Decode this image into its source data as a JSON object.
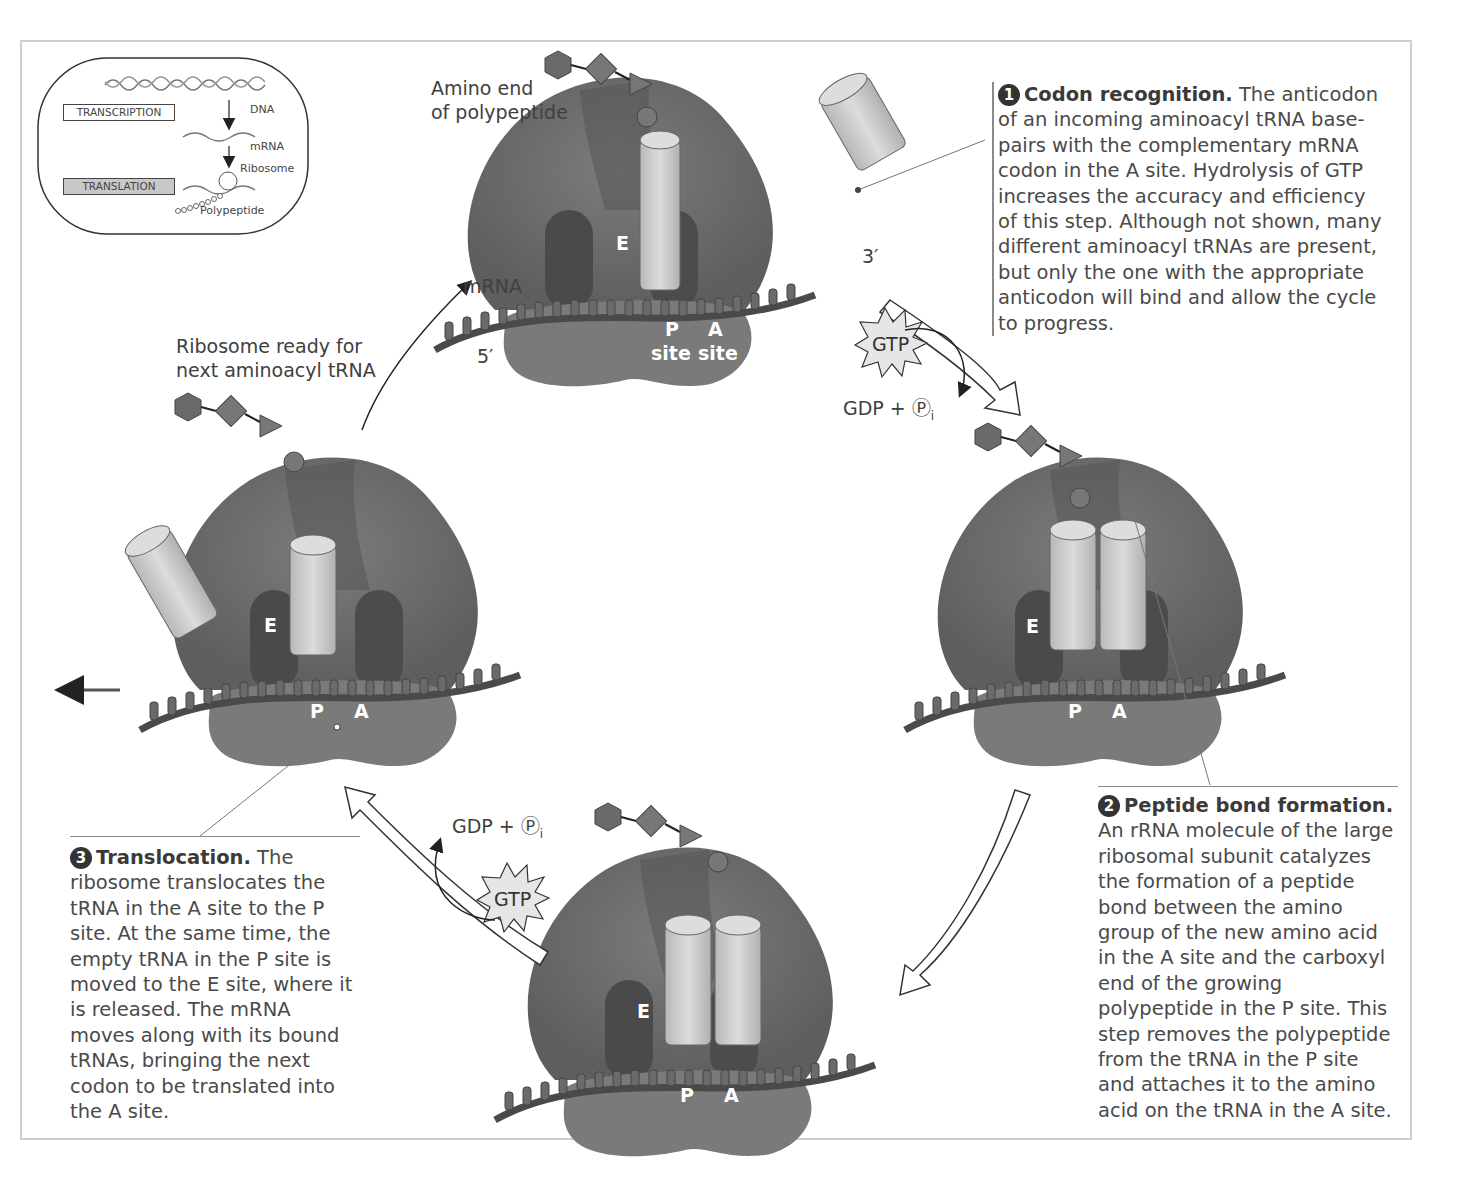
{
  "inset": {
    "dna_label": "DNA",
    "mrna_label": "mRNA",
    "ribosome_label": "Ribosome",
    "polypeptide_label": "Polypeptide",
    "transcription_box": "TRANSCRIPTION",
    "translation_box": "TRANSLATION"
  },
  "labels": {
    "amino_end_line1": "Amino end",
    "amino_end_line2": "of polypeptide",
    "mrna": "mRNA",
    "five_prime": "5′",
    "three_prime": "3′",
    "ready_line1": "Ribosome ready for",
    "ready_line2": "next aminoacyl tRNA",
    "gtp": "GTP",
    "gdp_pi": "GDP + Ⓟ",
    "subscript_i": "i"
  },
  "ribosomes": [
    {
      "position": "top",
      "e": "E",
      "p": "P",
      "a": "A",
      "p_site": "site",
      "a_site": "site"
    },
    {
      "position": "right",
      "e": "E",
      "p": "P",
      "a": "A"
    },
    {
      "position": "bottom",
      "e": "E",
      "p": "P",
      "a": "A"
    },
    {
      "position": "left",
      "e": "E",
      "p": "P",
      "a": "A"
    }
  ],
  "steps": [
    {
      "number": "1",
      "title": "Codon recognition.",
      "body": " The anticodon of an incoming aminoacyl tRNA base-pairs with the complementary mRNA codon in the A site. Hydrolysis of GTP increases the accuracy and efficiency of this step. Although not shown, many different aminoacyl tRNAs are present, but only the one with the appropriate anticodon will bind and allow the cycle to progress."
    },
    {
      "number": "2",
      "title": "Peptide bond formation.",
      "body": " An rRNA molecule of the large ribosomal subunit catalyzes the formation of a peptide bond between the amino group of the new amino acid in the A site and the carboxyl end of the growing polypeptide in the P site. This step removes the polypeptide from the tRNA in the P site and attaches it to the amino acid on the tRNA in the A site."
    },
    {
      "number": "3",
      "title": "Translocation.",
      "body": " The ribosome translocates the tRNA in the A site to the P site. At the same time, the empty tRNA in the P site is moved to the E site, where it is released. The mRNA moves along with its bound tRNAs, bringing the next codon to be translated into the A site."
    }
  ],
  "colors": {
    "ribosome_large": "#6e6e6e",
    "ribosome_small": "#7a7a7a",
    "site_dark": "#4a4a4a",
    "trna": "#c8c8c8",
    "mrna": "#5a5a5a",
    "gtp_fill": "#e6e6e6",
    "frame": "#cfcfcf"
  }
}
